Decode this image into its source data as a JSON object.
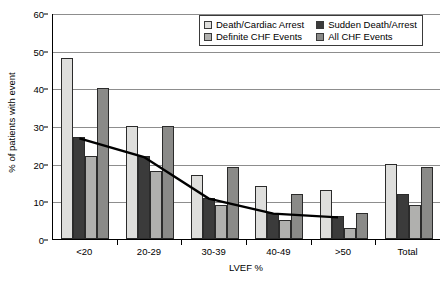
{
  "chart_data": {
    "type": "bar",
    "title": "",
    "xlabel": "LVEF %",
    "ylabel": "% of patients with event",
    "categories": [
      "<20",
      "20-29",
      "30-39",
      "40-49",
      ">50",
      "Total"
    ],
    "ylim": [
      0,
      60
    ],
    "yticks": [
      0,
      10,
      20,
      30,
      40,
      50,
      60
    ],
    "grid": true,
    "legend_position": "top-right",
    "series": [
      {
        "name": "Death/Cardiac Arrest",
        "color": "#dededc",
        "values": [
          48,
          30,
          17,
          14,
          13,
          20
        ]
      },
      {
        "name": "Sudden Death/Arrest",
        "color": "#3b3b3b",
        "values": [
          27,
          22,
          11,
          7,
          6,
          12
        ]
      },
      {
        "name": "Definite CHF Events",
        "color": "#b0b0ae",
        "values": [
          22,
          18,
          9,
          5,
          3,
          9
        ]
      },
      {
        "name": "All CHF Events",
        "color": "#8a8a88",
        "values": [
          40,
          30,
          19,
          12,
          7,
          19
        ]
      }
    ],
    "trend_line": {
      "name": "Sudden Death/Arrest trend",
      "color": "#000000",
      "values": [
        27,
        22,
        11,
        7,
        6
      ],
      "categories": [
        "<20",
        "20-29",
        "30-39",
        "40-49",
        ">50"
      ]
    }
  },
  "legend": {
    "entries": [
      {
        "label": "Death/Cardiac Arrest",
        "color": "#dededc"
      },
      {
        "label": "Sudden Death/Arrest",
        "color": "#3b3b3b"
      },
      {
        "label": "Definite CHF Events",
        "color": "#b0b0ae"
      },
      {
        "label": "All CHF Events",
        "color": "#8a8a88"
      }
    ]
  },
  "axes": {
    "y_title": "% of patients with event",
    "x_title": "LVEF %"
  }
}
